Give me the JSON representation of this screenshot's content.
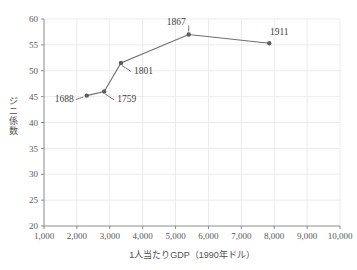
{
  "chart_data": {
    "type": "line",
    "title": "",
    "subtitle": "",
    "xlabel": "1人当たりGDP（1990年ドル）",
    "ylabel": "ジニ係数",
    "xlim": [
      1000,
      10000
    ],
    "ylim": [
      20,
      60
    ],
    "xticks": [
      1000,
      2000,
      3000,
      4000,
      5000,
      6000,
      7000,
      8000,
      9000,
      10000
    ],
    "xticklabels": [
      "1,000",
      "2,000",
      "3,000",
      "4,000",
      "5,000",
      "6,000",
      "7,000",
      "8,000",
      "9,000",
      "10,000"
    ],
    "yticks": [
      20,
      25,
      30,
      35,
      40,
      45,
      50,
      55,
      60
    ],
    "yticklabels": [
      "20",
      "25",
      "30",
      "35",
      "40",
      "45",
      "50",
      "55",
      "60"
    ],
    "grid": true,
    "legend": "none",
    "series": [
      {
        "name": "ジニ係数",
        "color": "#6e6e70",
        "marker": "circle",
        "points": [
          {
            "label": "1688",
            "x": 2300,
            "y": 45.2,
            "label_pos": "left"
          },
          {
            "label": "1759",
            "x": 2830,
            "y": 46.0,
            "label_pos": "below-right"
          },
          {
            "label": "1801",
            "x": 3340,
            "y": 51.5,
            "label_pos": "below-right"
          },
          {
            "label": "1867",
            "x": 5400,
            "y": 57.0,
            "label_pos": "above"
          },
          {
            "label": "1911",
            "x": 7850,
            "y": 55.3,
            "label_pos": "above"
          }
        ]
      }
    ]
  },
  "colors": {
    "line": "#6e6e70",
    "marker": "#5e5e60",
    "axis": "#8c8c8e",
    "grid": "#ebebec",
    "tick_text": "#58585a",
    "axis_title": "#4f4f51",
    "background": "#ffffff"
  },
  "axes": {
    "x_title": "1人当たりGDP（1990年ドル）",
    "y_title": "ジニ係数"
  }
}
